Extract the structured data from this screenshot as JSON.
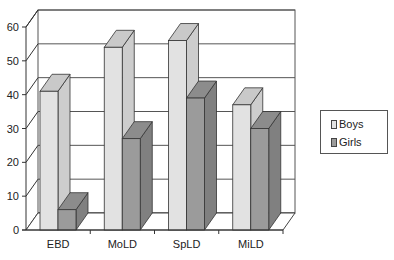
{
  "chart_data": {
    "type": "bar",
    "subtype": "3d-clustered-column",
    "title": "",
    "xlabel": "",
    "ylabel": "",
    "categories": [
      "EBD",
      "MoLD",
      "SpLD",
      "MiLD"
    ],
    "series": [
      {
        "name": "Boys",
        "values": [
          41,
          54,
          56,
          37
        ],
        "color_front": "#e2e2e2",
        "color_top": "#c9c9c9",
        "color_side": "#cdcdcd"
      },
      {
        "name": "Girls",
        "values": [
          6,
          27,
          39,
          30
        ],
        "color_front": "#9b9b9b",
        "color_top": "#8c8c8c",
        "color_side": "#808080"
      }
    ],
    "ylim": [
      0,
      60
    ],
    "yticks": [
      0,
      10,
      20,
      30,
      40,
      50,
      60
    ],
    "grid": true,
    "legend_position": "right"
  },
  "legend": {
    "items": [
      {
        "label": "Boys",
        "color": "#e2e2e2"
      },
      {
        "label": "Girls",
        "color": "#9b9b9b"
      }
    ]
  }
}
